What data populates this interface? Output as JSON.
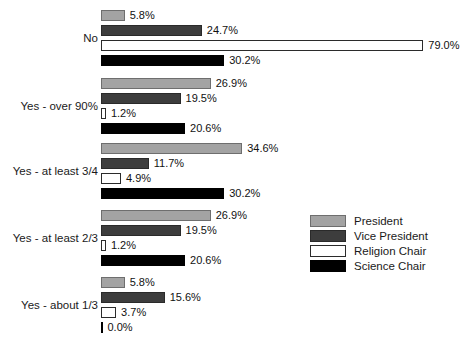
{
  "chart_data": {
    "type": "bar",
    "orientation": "horizontal",
    "title": "",
    "xlabel": "",
    "ylabel": "",
    "xlim": [
      0,
      79
    ],
    "grid": false,
    "legend_position": "center-right",
    "value_format": "percent",
    "categories": [
      "No",
      "Yes - over 90%",
      "Yes - at least 3/4",
      "Yes - at least 2/3",
      "Yes - about 1/3"
    ],
    "series": [
      {
        "name": "President",
        "color": "#a3a3a3",
        "values": [
          5.8,
          26.9,
          34.6,
          26.9,
          5.8
        ],
        "labels": [
          "5.8%",
          "26.9%",
          "34.6%",
          "26.9%",
          "5.8%"
        ]
      },
      {
        "name": "Vice President",
        "color": "#3d3d3d",
        "values": [
          24.7,
          19.5,
          11.7,
          19.5,
          15.6
        ],
        "labels": [
          "24.7%",
          "19.5%",
          "11.7%",
          "19.5%",
          "15.6%"
        ]
      },
      {
        "name": "Religion Chair",
        "color": "#ffffff",
        "values": [
          79.0,
          1.2,
          4.9,
          1.2,
          3.7
        ],
        "labels": [
          "79.0%",
          "1.2%",
          "4.9%",
          "1.2%",
          "3.7%"
        ]
      },
      {
        "name": "Science Chair",
        "color": "#000000",
        "values": [
          30.2,
          20.6,
          30.2,
          20.6,
          0.0
        ],
        "labels": [
          "30.2%",
          "20.6%",
          "30.2%",
          "20.6%",
          "0.0%"
        ]
      }
    ]
  },
  "legend": {
    "items": [
      {
        "label": "President"
      },
      {
        "label": "Vice President"
      },
      {
        "label": "Religion Chair"
      },
      {
        "label": "Science Chair"
      }
    ]
  }
}
